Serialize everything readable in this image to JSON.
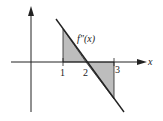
{
  "diagram": {
    "function_label": "f″(x)",
    "x_axis_label": "x",
    "ticks": [
      {
        "value": "1",
        "x": 63
      },
      {
        "value": "2",
        "x": 86
      },
      {
        "value": "3",
        "x": 114
      }
    ],
    "colors": {
      "line": "#222222",
      "shade": "#bdbdbd"
    }
  }
}
